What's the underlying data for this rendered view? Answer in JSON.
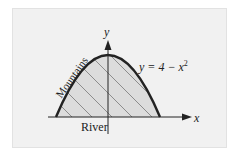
{
  "diagram": {
    "equation_label": "y = 4 − x²",
    "equation_parts": {
      "lhs": "y = 4 − x",
      "exp": "2"
    },
    "x_axis_label": "x",
    "y_axis_label": "y",
    "curve_label": "Mountains",
    "base_label": "River",
    "colors": {
      "panel": "#f1f1f1",
      "fill": "#dcdcdc",
      "curve": "#222222",
      "hatch": "#777777",
      "axis": "#222222"
    }
  }
}
